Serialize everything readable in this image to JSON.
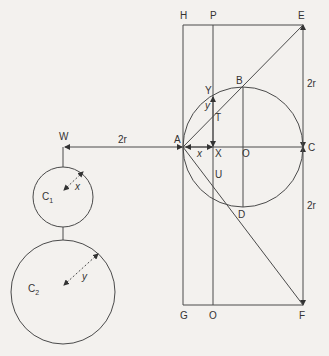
{
  "diagram": {
    "type": "geometric-construction",
    "stroke_color": "#4a4a4a",
    "background": "#f3f1ee",
    "points": {
      "H": "H",
      "P": "P",
      "E": "E",
      "Y": "Y",
      "B": "B",
      "T": "T",
      "A": "A",
      "X": "X",
      "O": "O",
      "C": "C",
      "U": "U",
      "D": "D",
      "G": "G",
      "O2": "O",
      "F": "F",
      "W": "W"
    },
    "dimensions": {
      "EC": "2r",
      "CF": "2r",
      "WA": "2r",
      "AX": "x",
      "XY": "y",
      "C1_radius": "x",
      "C2_radius": "y"
    },
    "circles": {
      "C1": {
        "label": "C",
        "subscript": "1"
      },
      "C2": {
        "label": "C",
        "subscript": "2"
      }
    }
  }
}
